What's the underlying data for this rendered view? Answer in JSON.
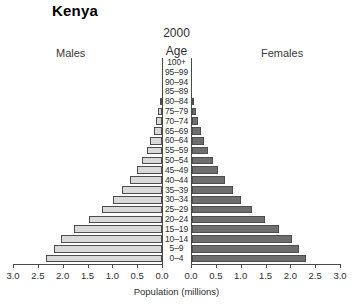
{
  "chart_data": {
    "type": "bar",
    "subtype": "population-pyramid",
    "title": "Kenya",
    "subtitle": "2000",
    "xlabel": "Population (millions)",
    "ylabel": "Age",
    "grid": false,
    "legend_position": "inline-top",
    "xlim_left": [
      3.0,
      0.0
    ],
    "xlim_right": [
      0.0,
      3.0
    ],
    "xticks": [
      "3.0",
      "2.5",
      "2.0",
      "1.5",
      "1.0",
      "0.5",
      "0.0",
      "0.0",
      "0.5",
      "1.0",
      "1.5",
      "2.0",
      "2.5",
      "3.0"
    ],
    "xticks_left": [
      "3.0",
      "2.5",
      "2.0",
      "1.5",
      "1.0",
      "0.5",
      "0.0"
    ],
    "xticks_right": [
      "0.0",
      "0.5",
      "1.0",
      "1.5",
      "2.0",
      "2.5",
      "3.0"
    ],
    "left_series_label": "Males",
    "right_series_label": "Females",
    "categories": [
      "100+",
      "95–99",
      "90–94",
      "85–89",
      "80–84",
      "75–79",
      "70–74",
      "65–69",
      "60–64",
      "55–59",
      "50–54",
      "45–49",
      "40–44",
      "35–39",
      "30–34",
      "25–29",
      "20–24",
      "15–19",
      "10–14",
      "5–9",
      "0–4"
    ],
    "series": [
      {
        "name": "Males",
        "color": "#d9d9d9",
        "values": [
          0.0,
          0.0,
          0.01,
          0.02,
          0.05,
          0.08,
          0.12,
          0.17,
          0.24,
          0.31,
          0.4,
          0.51,
          0.64,
          0.8,
          0.98,
          1.21,
          1.47,
          1.78,
          2.03,
          2.18,
          2.33
        ]
      },
      {
        "name": "Females",
        "color": "#6e6e6e",
        "values": [
          0.0,
          0.0,
          0.01,
          0.02,
          0.05,
          0.08,
          0.13,
          0.18,
          0.25,
          0.33,
          0.42,
          0.53,
          0.66,
          0.82,
          0.99,
          1.2,
          1.46,
          1.76,
          2.01,
          2.16,
          2.3
        ]
      }
    ]
  }
}
